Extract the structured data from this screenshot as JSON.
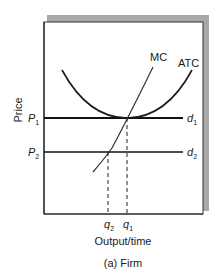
{
  "figure": {
    "caption": "(a) Firm",
    "x_axis_label": "Output/time",
    "y_axis_label": "Price",
    "curves": {
      "mc": "MC",
      "atc": "ATC"
    },
    "price_levels": [
      {
        "label": "P",
        "sub": "1",
        "demand_label": "d",
        "demand_sub": "1"
      },
      {
        "label": "P",
        "sub": "2",
        "demand_label": "d",
        "demand_sub": "2"
      }
    ],
    "quantities": [
      {
        "label": "q",
        "sub": "2"
      },
      {
        "label": "q",
        "sub": "1"
      }
    ],
    "colors": {
      "frame": "#333333",
      "shadow": "#a8a8a8",
      "curve": "#1a1a1a",
      "demand_line": "#111111"
    }
  }
}
